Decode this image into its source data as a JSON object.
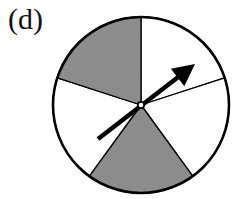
{
  "figure": {
    "label": "(d)",
    "center": [
      141,
      105
    ],
    "radius": 88,
    "colors": {
      "shaded": "#8c8c8c",
      "unshaded": "#ffffff",
      "stroke": "#000000"
    },
    "sectors": [
      {
        "start_deg": -90,
        "end_deg": -18,
        "shaded": false
      },
      {
        "start_deg": -18,
        "end_deg": 54,
        "shaded": false
      },
      {
        "start_deg": 54,
        "end_deg": 126,
        "shaded": true
      },
      {
        "start_deg": 126,
        "end_deg": 198,
        "shaded": false
      },
      {
        "start_deg": 198,
        "end_deg": 270,
        "shaded": true
      }
    ],
    "arrow": {
      "tail": [
        98,
        139
      ],
      "tip": [
        195,
        64
      ]
    }
  }
}
